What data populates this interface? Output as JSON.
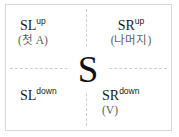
{
  "diagram": {
    "center_symbol": "S",
    "quadrants": [
      {
        "position": "top-left",
        "base": "SL",
        "superscript": "up",
        "note": "(첫 A)"
      },
      {
        "position": "top-right",
        "base": "SR",
        "superscript": "up",
        "note": "(나머지)"
      },
      {
        "position": "bottom-left",
        "base": "SL",
        "superscript": "down",
        "note": ""
      },
      {
        "position": "bottom-right",
        "base": "SR",
        "superscript": "down",
        "note": "(V)"
      }
    ],
    "colors": {
      "border": "#d8d8d8",
      "divider": "#cfcfcf",
      "text": "#1a1a1a",
      "note_text": "#5e5e5e",
      "background": "#ffffff"
    }
  }
}
